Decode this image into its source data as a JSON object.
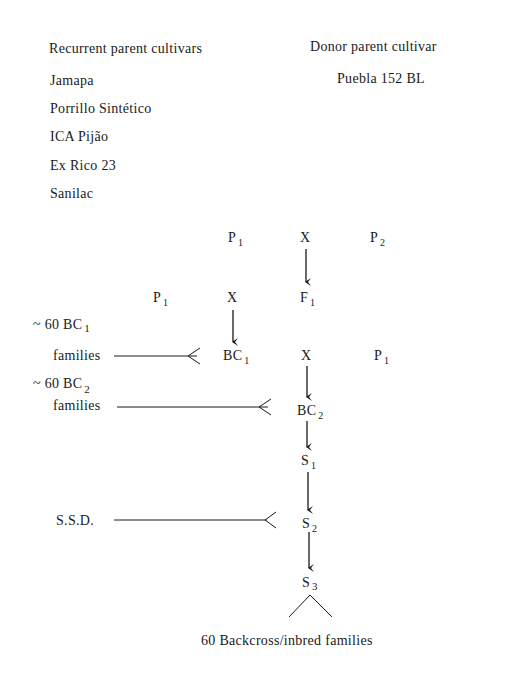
{
  "header": {
    "recurrent_title": "Recurrent parent cultivars",
    "donor_title": "Donor parent cultivar"
  },
  "recurrent_cultivars": [
    "Jamapa",
    "Porrillo Sintético",
    "ICA Pijão",
    "Ex Rico 23",
    "Sanilac"
  ],
  "donor_cultivar": "Puebla 152 BL",
  "scheme": {
    "row1": {
      "left": "P",
      "left_sub": "1",
      "cross": "X",
      "right": "P",
      "right_sub": "2"
    },
    "row2": {
      "left": "P",
      "left_sub": "1",
      "cross": "X",
      "right": "F",
      "right_sub": "1"
    },
    "row3": {
      "left": "BC",
      "left_sub": "1",
      "cross": "X",
      "right": "P",
      "right_sub": "1"
    },
    "bc2": {
      "label": "BC",
      "sub": "2"
    },
    "s1": {
      "label": "S",
      "sub": "1"
    },
    "s2": {
      "label": "S",
      "sub": "2"
    },
    "s3": {
      "label": "S",
      "sub": "3"
    }
  },
  "side_labels": {
    "bc1_count": "~ 60 BC",
    "bc1_sub": "1",
    "bc1_families": "families",
    "bc2_count": "~ 60 BC",
    "bc2_sub": "2",
    "bc2_families": "families",
    "ssd": "S.S.D."
  },
  "footer": "60 Backcross/inbred families"
}
